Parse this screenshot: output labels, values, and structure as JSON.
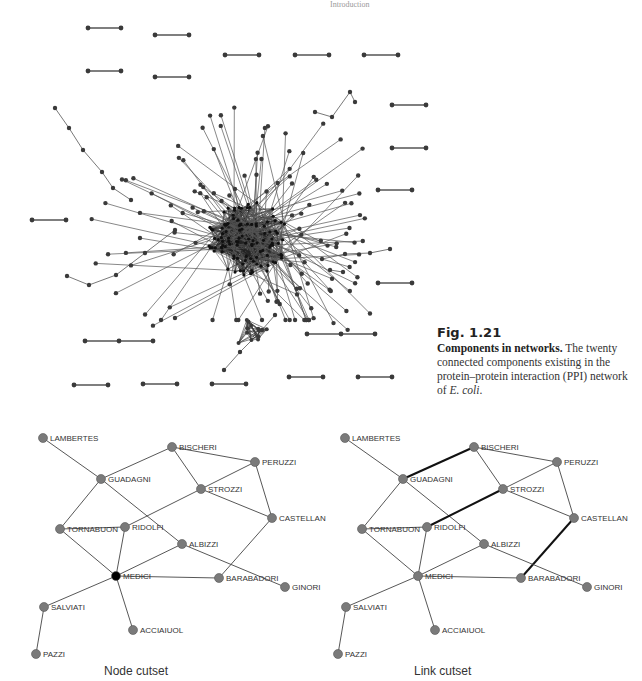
{
  "header": {
    "running_title": "Introduction"
  },
  "caption": {
    "figure_number": "Fig. 1.21",
    "title": "Components in networks.",
    "body": "The twenty connected components existing in the protein–protein interaction (PPI) network of",
    "species": "E. coli",
    "end": "."
  },
  "panels": {
    "node_cutset": {
      "label": "Node cutset"
    },
    "link_cutset": {
      "label": "Link cutset"
    }
  },
  "florentine": {
    "nodes": [
      {
        "id": "LAMBERTES",
        "x": 43,
        "y": 438
      },
      {
        "id": "BISCHERI",
        "x": 172,
        "y": 447
      },
      {
        "id": "PERUZZI",
        "x": 255,
        "y": 462
      },
      {
        "id": "GUADAGNI",
        "x": 101,
        "y": 479
      },
      {
        "id": "STROZZI",
        "x": 201,
        "y": 489
      },
      {
        "id": "CASTELLAN",
        "x": 272,
        "y": 518
      },
      {
        "id": "TORNABUON",
        "x": 60,
        "y": 529
      },
      {
        "id": "RIDOLFI",
        "x": 125,
        "y": 527
      },
      {
        "id": "ALBIZZI",
        "x": 182,
        "y": 544
      },
      {
        "id": "MEDICI",
        "x": 116,
        "y": 576
      },
      {
        "id": "BARABADORI",
        "x": 219,
        "y": 578
      },
      {
        "id": "GINORI",
        "x": 285,
        "y": 587
      },
      {
        "id": "SALVIATI",
        "x": 44,
        "y": 607
      },
      {
        "id": "ACCIAIUOL",
        "x": 133,
        "y": 630
      },
      {
        "id": "PAZZI",
        "x": 36,
        "y": 654
      }
    ],
    "edges": [
      [
        "LAMBERTES",
        "GUADAGNI"
      ],
      [
        "GUADAGNI",
        "BISCHERI"
      ],
      [
        "GUADAGNI",
        "TORNABUON"
      ],
      [
        "GUADAGNI",
        "ALBIZZI"
      ],
      [
        "BISCHERI",
        "STROZZI"
      ],
      [
        "BISCHERI",
        "PERUZZI"
      ],
      [
        "PERUZZI",
        "STROZZI"
      ],
      [
        "PERUZZI",
        "CASTELLAN"
      ],
      [
        "STROZZI",
        "CASTELLAN"
      ],
      [
        "STROZZI",
        "RIDOLFI"
      ],
      [
        "CASTELLAN",
        "BARABADORI"
      ],
      [
        "TORNABUON",
        "RIDOLFI"
      ],
      [
        "TORNABUON",
        "MEDICI"
      ],
      [
        "RIDOLFI",
        "MEDICI"
      ],
      [
        "ALBIZZI",
        "MEDICI"
      ],
      [
        "ALBIZZI",
        "GINORI"
      ],
      [
        "MEDICI",
        "BARABADORI"
      ],
      [
        "MEDICI",
        "SALVIATI"
      ],
      [
        "MEDICI",
        "ACCIAIUOL"
      ],
      [
        "SALVIATI",
        "PAZZI"
      ]
    ],
    "node_cutset_highlight": [
      "MEDICI"
    ],
    "link_cutset_highlight": [
      [
        "GUADAGNI",
        "BISCHERI"
      ],
      [
        "STROZZI",
        "RIDOLFI"
      ],
      [
        "CASTELLAN",
        "BARABADORI"
      ]
    ],
    "right_offset_x": 302,
    "colors": {
      "node": "#7a7a7a",
      "node_cut": "#000000",
      "edge": "#444444",
      "edge_cut": "#111111"
    }
  },
  "ppi": {
    "small_components": [
      [
        [
          88,
          28
        ],
        [
          121,
          28
        ]
      ],
      [
        [
          155,
          35
        ],
        [
          189,
          35
        ]
      ],
      [
        [
          88,
          71
        ],
        [
          121,
          71
        ]
      ],
      [
        [
          155,
          77
        ],
        [
          189,
          77
        ]
      ],
      [
        [
          225,
          55
        ],
        [
          259,
          55
        ]
      ],
      [
        [
          295,
          55
        ],
        [
          329,
          55
        ]
      ],
      [
        [
          364,
          55
        ],
        [
          398,
          55
        ]
      ],
      [
        [
          392,
          105
        ],
        [
          426,
          105
        ]
      ],
      [
        [
          392,
          148
        ],
        [
          426,
          148
        ]
      ],
      [
        [
          378,
          190
        ],
        [
          412,
          190
        ]
      ],
      [
        [
          32,
          220
        ],
        [
          66,
          220
        ]
      ],
      [
        [
          378,
          283
        ],
        [
          412,
          283
        ]
      ],
      [
        [
          85,
          341
        ],
        [
          119,
          341
        ],
        [
          153,
          341
        ]
      ],
      [
        [
          307,
          334
        ],
        [
          341,
          334
        ],
        [
          375,
          334
        ]
      ],
      [
        [
          74,
          385
        ],
        [
          108,
          385
        ]
      ],
      [
        [
          143,
          384
        ],
        [
          177,
          384
        ]
      ],
      [
        [
          212,
          384
        ],
        [
          246,
          384
        ]
      ],
      [
        [
          289,
          377
        ],
        [
          323,
          377
        ]
      ],
      [
        [
          358,
          377
        ],
        [
          392,
          377
        ]
      ]
    ],
    "core_center": [
      248,
      238
    ],
    "colors": {
      "node": "#3a3a3a",
      "edge": "#555555"
    }
  }
}
